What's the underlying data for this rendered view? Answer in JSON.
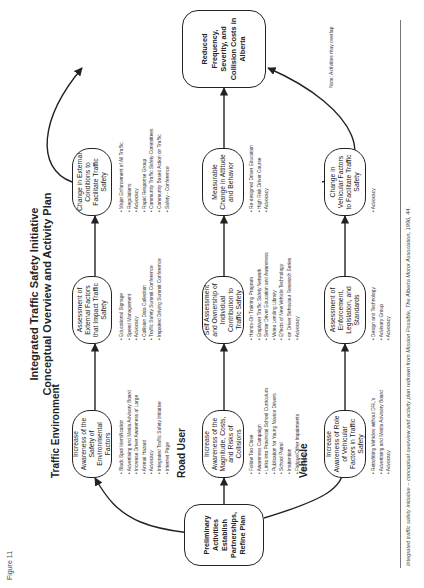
{
  "figure_label": "Figure 11",
  "title": {
    "line1": "Integrated Traffic Safety Initiative",
    "line2": "Conceptual Overview and Activity Plan"
  },
  "rows": {
    "traffic_environment": "Traffic Environment",
    "road_user": "Road User",
    "vehicle": "Vehicle"
  },
  "nodes": {
    "preliminary": "Preliminary Activities Establish Partnerships, Refine Plan",
    "goal": "Reduced Frequency, Severity, and Collision Costs in Alberta",
    "te1": "Increase Awareness of the Safety of Environmental Factors",
    "te2": "Assessment of External Factors that Impact Traffic Safety",
    "te3": "Change in External Conditions to Facilitate Traffic Safety",
    "ru1": "Increase Awareness of the Magnitude, Costs, and Risks of Collisions",
    "ru2": "Self Assessment and Ownership of Individual Contribution to Traffic Safety",
    "ru3": "Measurable Change in Attitude and Behavior",
    "ve1": "Increase Awareness of Role of Vehicular Factors in Traffic Safety",
    "ve2": "Assessment of Enforcement, Legislation, and Standards",
    "ve3": "Change in Vehicular Factors to Facilitate Traffic Safety"
  },
  "activities": {
    "te1": [
      "Black Spot Identification",
      "Advertising and Media Advisory Board",
      "Increase Driver Awareness of Large",
      "Animal Hazard",
      "Advocacy",
      "Integrated Traffic Safety Initiative",
      "Internet Page"
    ],
    "te2": [
      "Educational Signage",
      "Speed Management",
      "Advocacy",
      "Collision Data Collection",
      "Traffic Safety Summit Conference",
      "Impaired Driving Summit Conference"
    ],
    "te3": [
      "Major Enforcement of All Traffic",
      "Regulations",
      "Advocacy",
      "Rapid Response Group",
      "Community Traffic Safety Committees",
      "Community Based Action on Traffic",
      "Safety - Conference"
    ],
    "ru1": [
      "Follow Too Close",
      "Awareness Campaign",
      "Links into Provincial School Curriculum",
      "Publication for Young Novice Drivers",
      "School Patrol",
      "Inattention",
      "Fatigue/Other Impairments",
      "Advocacy"
    ],
    "ru2": [
      "Hands-On Training Program",
      "Employer Traffic Safety Network",
      "Senior Driver Education and Awareness",
      "Video Lending Library",
      "Effects of New Vehicle Technology",
      "on Driver Behaviour Research Series",
      "Advocacy"
    ],
    "ru3": [
      "Re-designed Driver Education",
      "High Risk Driver Course",
      "Advocacy"
    ],
    "ve1": [
      "Retrofitting Vehicles without DRL's",
      "Advertising and Media Advisory Board",
      "Advocacy"
    ],
    "ve2": [
      "Design and Technology",
      "Advisory Group",
      "Advocacy"
    ],
    "ve3": [
      "Advocacy"
    ]
  },
  "note": "Note: Activities may overlap",
  "caption": "Integrated traffic safety initiative – conceptual overview and activity plan redrawn from Mission Possible, The Alberta Motor Association, 1996, 44."
}
